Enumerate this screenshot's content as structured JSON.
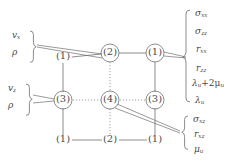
{
  "figure": {
    "type": "staggered-grid-stencil-diagram",
    "background": "#ffffff",
    "stroke_color": "#6e6e6e",
    "text_color": "#4a4a4a"
  },
  "grid": {
    "rows": [
      {
        "row": "top",
        "nodes": [
          {
            "label": "(1)",
            "circled": false,
            "x": 63,
            "y": 58
          },
          {
            "label": "(2)",
            "circled": true,
            "x": 110,
            "y": 53
          },
          {
            "label": "(1)",
            "circled": true,
            "x": 155,
            "y": 53
          }
        ]
      },
      {
        "row": "middle",
        "nodes": [
          {
            "label": "(3)",
            "circled": true,
            "x": 63,
            "y": 100
          },
          {
            "label": "(4)",
            "circled": true,
            "x": 110,
            "y": 100
          },
          {
            "label": "(3)",
            "circled": true,
            "x": 155,
            "y": 100
          }
        ]
      },
      {
        "row": "bottom",
        "nodes": [
          {
            "label": "(1)",
            "circled": false,
            "x": 63,
            "y": 140
          },
          {
            "label": "(2)",
            "circled": false,
            "x": 110,
            "y": 140
          },
          {
            "label": "(1)",
            "circled": false,
            "x": 155,
            "y": 140
          }
        ]
      }
    ]
  },
  "left_groups": [
    {
      "name": "upper-left-variable-group",
      "items": [
        {
          "sym": "v",
          "sub": "x"
        },
        {
          "sym": "ρ",
          "sub": ""
        }
      ],
      "brace": "}"
    },
    {
      "name": "lower-left-variable-group",
      "items": [
        {
          "sym": "v",
          "sub": "z"
        },
        {
          "sym": "ρ",
          "sub": ""
        }
      ],
      "brace": "}"
    }
  ],
  "right_groups": [
    {
      "name": "upper-right-variable-group",
      "brace": "{",
      "items": [
        {
          "text": "σ",
          "sub": "xx",
          "op": ""
        },
        {
          "text": "σ",
          "sub": "zz",
          "op": ""
        },
        {
          "text": "r",
          "sub": "xx",
          "op": ""
        },
        {
          "text": "r",
          "sub": "zz",
          "op": ""
        },
        {
          "text": "λ",
          "sub": "u",
          "op": "+2μ",
          "op_sub": "u"
        },
        {
          "text": "λ",
          "sub": "u",
          "op": ""
        }
      ]
    },
    {
      "name": "lower-right-variable-group",
      "brace": "{",
      "items": [
        {
          "text": "σ",
          "sub": "xz",
          "op": ""
        },
        {
          "text": "r",
          "sub": "xz",
          "op": ""
        },
        {
          "text": "μ",
          "sub": "u",
          "op": ""
        }
      ]
    }
  ],
  "labels": {
    "v_x": "v",
    "v_x_sub": "x",
    "v_z": "v",
    "v_z_sub": "z",
    "rho": "ρ",
    "sigma_xx": "σ",
    "sigma_xx_sub": "xx",
    "sigma_zz": "σ",
    "sigma_zz_sub": "zz",
    "r_xx": "r",
    "r_xx_sub": "xx",
    "r_zz": "r",
    "r_zz_sub": "zz",
    "lambda_u": "λ",
    "lambda_u_sub": "u",
    "lambda_plus_2mu": "+2μ",
    "lambda_plus_2mu_sub": "u",
    "lambda_u2": "λ",
    "lambda_u2_sub": "u",
    "sigma_xz": "σ",
    "sigma_xz_sub": "xz",
    "r_xz": "r",
    "r_xz_sub": "xz",
    "mu_u": "μ",
    "mu_u_sub": "u",
    "brace_right": "{",
    "brace_left": "}"
  },
  "node_labels": {
    "n1": "(1)",
    "n2": "(2)",
    "n3": "(3)",
    "n4": "(4)"
  }
}
